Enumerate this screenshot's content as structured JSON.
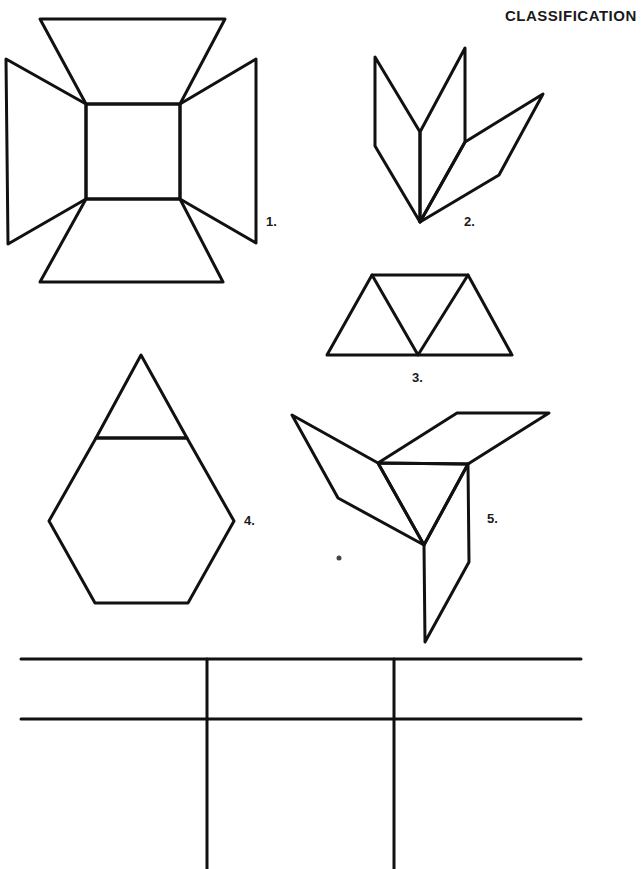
{
  "header": {
    "title": "CLASSIFICATION"
  },
  "figures": [
    {
      "id": 1,
      "label": "1.",
      "description": "square surrounded by four trapezoids"
    },
    {
      "id": 2,
      "label": "2.",
      "description": "three rhombuses joined at a point"
    },
    {
      "id": 3,
      "label": "3.",
      "description": "three triangles forming a trapezoid"
    },
    {
      "id": 4,
      "label": "4.",
      "description": "triangle atop a hexagon"
    },
    {
      "id": 5,
      "label": "5.",
      "description": "triangle with three rhombuses"
    }
  ],
  "table": {
    "columns": 3,
    "header_row": [
      "",
      "",
      ""
    ],
    "rows": [
      [
        "",
        "",
        ""
      ]
    ]
  },
  "colors": {
    "ink": "#111111",
    "paper": "#ffffff"
  }
}
